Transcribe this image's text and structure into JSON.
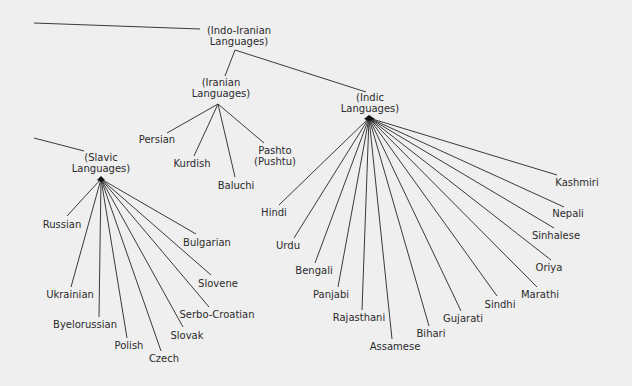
{
  "diagram": {
    "line_color": "#3a3a3a",
    "background": "#efefef",
    "nodes": {
      "indo_iranian": {
        "line1": "(Indo-Iranian",
        "line2": "Languages)"
      },
      "iranian": {
        "line1": "(Iranian",
        "line2": "Languages)"
      },
      "indic": {
        "line1": "(Indic",
        "line2": "Languages)"
      },
      "slavic": {
        "line1": "(Slavic",
        "line2": "Languages)"
      }
    },
    "iranian_children": [
      {
        "label": "Persian"
      },
      {
        "label": "Kurdish"
      },
      {
        "label": "Baluchi"
      },
      {
        "label": "Pashto",
        "label2": "(Pushtu)"
      }
    ],
    "indic_children": [
      {
        "label": "Hindi"
      },
      {
        "label": "Urdu"
      },
      {
        "label": "Bengali"
      },
      {
        "label": "Panjabi"
      },
      {
        "label": "Rajasthani"
      },
      {
        "label": "Assamese"
      },
      {
        "label": "Bihari"
      },
      {
        "label": "Gujarati"
      },
      {
        "label": "Sindhi"
      },
      {
        "label": "Marathi"
      },
      {
        "label": "Oriya"
      },
      {
        "label": "Sinhalese"
      },
      {
        "label": "Nepali"
      },
      {
        "label": "Kashmiri"
      }
    ],
    "slavic_children": [
      {
        "label": "Russian"
      },
      {
        "label": "Ukrainian"
      },
      {
        "label": "Byelorussian"
      },
      {
        "label": "Polish"
      },
      {
        "label": "Czech"
      },
      {
        "label": "Slovak"
      },
      {
        "label": "Serbo-Croatian"
      },
      {
        "label": "Slovene"
      },
      {
        "label": "Bulgarian"
      }
    ]
  }
}
